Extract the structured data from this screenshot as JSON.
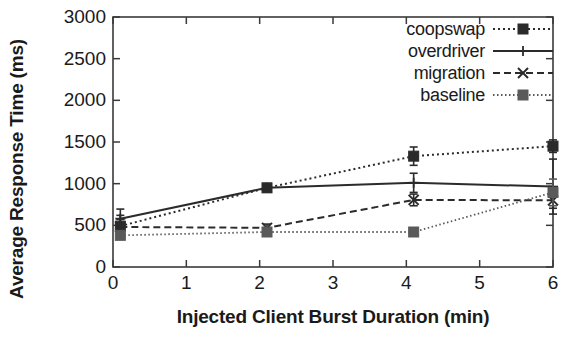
{
  "chart_data": {
    "type": "line",
    "title": "",
    "xlabel": "Injected Client Burst Duration (min)",
    "ylabel": "Average Response Time (ms)",
    "xlim": [
      0,
      6
    ],
    "ylim": [
      0,
      3000
    ],
    "xticks": [
      0,
      1,
      2,
      3,
      4,
      5,
      6
    ],
    "yticks": [
      0,
      500,
      1000,
      1500,
      2000,
      2500,
      3000
    ],
    "xtick_labels": [
      "0",
      "1",
      "2",
      "3",
      "4",
      "5",
      "6"
    ],
    "ytick_labels": [
      "0",
      "500",
      "1000",
      "1500",
      "2000",
      "2500",
      "3000"
    ],
    "grid": false,
    "legend_position": "top-right",
    "error_bars": true,
    "series": [
      {
        "name": "coopswap",
        "line_style": "dotted",
        "marker": "filled-square",
        "color": "#2b2b2b",
        "x": [
          0.1,
          2.1,
          4.1,
          6.0
        ],
        "y": [
          490,
          950,
          1330,
          1450
        ],
        "yerr": [
          130,
          45,
          110,
          75
        ]
      },
      {
        "name": "overdriver",
        "line_style": "solid",
        "marker": "plus",
        "color": "#2b2b2b",
        "x": [
          0.1,
          2.1,
          4.1,
          6.0
        ],
        "y": [
          580,
          950,
          1010,
          965
        ],
        "yerr": [
          115,
          50,
          115,
          330
        ]
      },
      {
        "name": "migration",
        "line_style": "dashed",
        "marker": "cross",
        "color": "#2b2b2b",
        "x": [
          0.1,
          2.1,
          4.1,
          6.0
        ],
        "y": [
          480,
          470,
          805,
          800
        ],
        "yerr": [
          90,
          45,
          70,
          95
        ]
      },
      {
        "name": "baseline",
        "line_style": "dash-dot",
        "marker": "filled-square",
        "color": "#5a5a5a",
        "x": [
          0.1,
          2.1,
          4.1,
          6.0
        ],
        "y": [
          380,
          420,
          420,
          895
        ],
        "yerr": [
          35,
          30,
          25,
          160
        ]
      }
    ]
  },
  "legend": {
    "items": [
      {
        "label": "coopswap"
      },
      {
        "label": "overdriver"
      },
      {
        "label": "migration"
      },
      {
        "label": "baseline"
      }
    ]
  }
}
